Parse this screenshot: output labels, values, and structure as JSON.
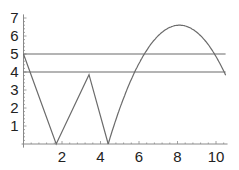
{
  "chart_data": {
    "type": "line",
    "title": "",
    "xlabel": "",
    "ylabel": "",
    "xlim": [
      0,
      10.6
    ],
    "ylim": [
      0,
      7.2
    ],
    "grid": false,
    "legend": null,
    "x_ticks": [
      2,
      4,
      6,
      8,
      10
    ],
    "y_ticks": [
      1,
      2,
      3,
      4,
      5,
      6,
      7
    ],
    "x_tick_labels": [
      "2",
      "4",
      "6",
      "8",
      "10"
    ],
    "y_tick_labels": [
      "1",
      "2",
      "3",
      "4",
      "5",
      "6",
      "7"
    ],
    "series": [
      {
        "name": "piecewise curve",
        "kind": "polyline",
        "color": "#6b6b6b",
        "x": [
          0,
          1.7,
          3.4,
          4.4
        ],
        "y": [
          5,
          0,
          3.85,
          0
        ]
      },
      {
        "name": "parabola segment",
        "kind": "parabola",
        "color": "#6b6b6b",
        "x_range": [
          4.4,
          10.5
        ],
        "vertex": [
          8.1,
          6.6
        ],
        "a": -0.482
      },
      {
        "name": "horizontal line y=5",
        "kind": "hline",
        "color": "#6b6b6b",
        "y": 5,
        "x_range": [
          0,
          10.5
        ]
      },
      {
        "name": "horizontal line y=4",
        "kind": "hline",
        "color": "#6b6b6b",
        "y": 4,
        "x_range": [
          0,
          10.5
        ]
      }
    ]
  },
  "layout": {
    "origin_px": [
      23.5,
      144
    ],
    "px_per_x": 19.25,
    "px_per_y": 18,
    "axis_color": "#8a8a8a",
    "line_color": "#6b6b6b"
  }
}
